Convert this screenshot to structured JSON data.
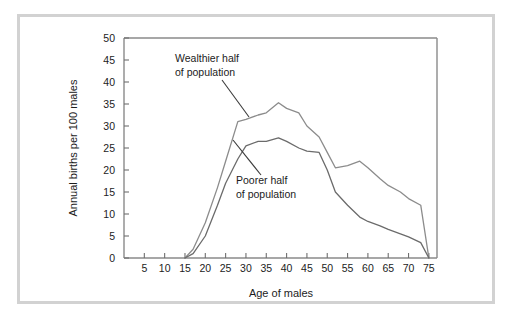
{
  "figure": {
    "background_color": "#ffffff",
    "border_color": "#d2d2d2"
  },
  "chart_data": {
    "type": "line",
    "title": "",
    "xlabel": "Age of males",
    "ylabel": "Annual births per 100 males",
    "xlim": [
      0,
      77
    ],
    "ylim": [
      0,
      50
    ],
    "grid": false,
    "legend_position": "inline-annotations",
    "xticks": [
      5,
      10,
      15,
      20,
      25,
      30,
      35,
      40,
      45,
      50,
      55,
      60,
      65,
      70,
      75
    ],
    "yticks": [
      0,
      5,
      10,
      15,
      20,
      25,
      30,
      35,
      40,
      45,
      50
    ],
    "series": [
      {
        "name": "Wealthier half of population",
        "color": "#8c8c8c",
        "x": [
          15,
          17,
          20,
          23,
          25,
          28,
          30,
          33,
          35,
          38,
          40,
          43,
          45,
          48,
          50,
          52,
          55,
          58,
          60,
          63,
          65,
          68,
          70,
          73,
          75
        ],
        "values": [
          0,
          2,
          8,
          16,
          22,
          31,
          31.5,
          32.5,
          33,
          35.3,
          34,
          33,
          30,
          27.5,
          24,
          20.5,
          21,
          22,
          20.5,
          18,
          16.5,
          15,
          13.5,
          12,
          0
        ]
      },
      {
        "name": "Poorer half of population",
        "color": "#6b6b6b",
        "x": [
          15,
          17,
          20,
          23,
          25,
          28,
          30,
          33,
          35,
          38,
          40,
          43,
          45,
          48,
          50,
          52,
          55,
          58,
          60,
          63,
          65,
          68,
          70,
          73,
          75
        ],
        "values": [
          0,
          1,
          5,
          12,
          17,
          22.5,
          25.5,
          26.5,
          26.5,
          27.3,
          26.5,
          25,
          24.3,
          24,
          20,
          15,
          12,
          9.3,
          8.3,
          7.3,
          6.5,
          5.5,
          4.8,
          3.5,
          0
        ]
      }
    ],
    "annotations": [
      {
        "id": "wealthier",
        "line1": "Wealthier half",
        "line2": "of population",
        "text_x": 175,
        "text_y": 62,
        "leader": [
          [
            222,
            80
          ],
          [
            249,
            117
          ]
        ]
      },
      {
        "id": "poorer",
        "line1": "Poorer half",
        "line2": "of population",
        "text_x": 236,
        "text_y": 184,
        "leader": [
          [
            233,
            140
          ],
          [
            261,
            175
          ]
        ]
      }
    ]
  }
}
